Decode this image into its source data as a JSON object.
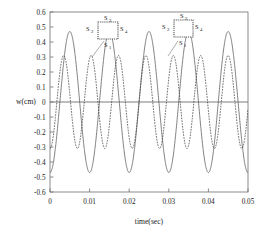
{
  "chart_data": {
    "type": "line",
    "title": "",
    "xlabel": "time(sec)",
    "ylabel": "w(cm)",
    "xlim": [
      0,
      0.05
    ],
    "ylim": [
      -0.6,
      0.6
    ],
    "xticks": [
      0,
      0.01,
      0.02,
      0.03,
      0.04,
      0.05
    ],
    "xticklabels": [
      "0",
      "0.01",
      "0.02",
      "0.03",
      "0.04",
      "0.05"
    ],
    "yticks": [
      -0.6,
      -0.5,
      -0.4,
      -0.3,
      -0.2,
      -0.1,
      0,
      0.1,
      0.2,
      0.3,
      0.4,
      0.5,
      0.6
    ],
    "yticklabels": [
      "-0.6",
      "-0.5",
      "-0.4",
      "-0.3",
      "-0.2",
      "-0.1",
      "0",
      "0.1",
      "0.2",
      "0.3",
      "0.4",
      "0.5",
      "0.6"
    ],
    "grid": false,
    "legend": "none",
    "zero_line": true,
    "series": [
      {
        "name": "solid-curve",
        "style": "solid",
        "color": "#555555",
        "amplitude": 0.47,
        "period": 0.01,
        "phase_deg": -90,
        "points_x": [
          0,
          0.0025,
          0.005,
          0.0075,
          0.01,
          0.0125,
          0.015,
          0.0175,
          0.02,
          0.0225,
          0.025,
          0.0275,
          0.03,
          0.0325,
          0.035,
          0.0375,
          0.04,
          0.0425,
          0.045,
          0.0475,
          0.05
        ],
        "points_y": [
          0.0,
          -0.47,
          0.0,
          0.47,
          0.0,
          -0.47,
          0.0,
          0.47,
          0.0,
          -0.47,
          0.0,
          0.47,
          0.0,
          -0.47,
          0.0,
          0.47,
          0.0,
          -0.47,
          0.0,
          0.47,
          0.0
        ]
      },
      {
        "name": "dashed-curve",
        "style": "dashed",
        "color": "#3a3a3a",
        "amplitude": 0.31,
        "period": 0.00692,
        "phase_deg": -90,
        "points_x": [
          0,
          0.00173,
          0.00346,
          0.00519,
          0.00692,
          0.00865,
          0.01038,
          0.01211,
          0.01384,
          0.01557,
          0.0173,
          0.01903,
          0.02076,
          0.02249,
          0.02422,
          0.02595,
          0.02768,
          0.02941,
          0.03114,
          0.03287,
          0.0346,
          0.03633,
          0.03806,
          0.03979,
          0.04152,
          0.04325,
          0.04498,
          0.04671,
          0.04844,
          0.05
        ],
        "points_y": [
          0.0,
          -0.31,
          0.0,
          0.31,
          0.0,
          -0.31,
          0.0,
          0.31,
          0.0,
          -0.31,
          0.0,
          0.31,
          0.0,
          -0.31,
          0.0,
          0.31,
          0.0,
          -0.31,
          0.0,
          0.31,
          0.0,
          -0.31,
          0.0,
          0.31,
          0.0,
          -0.31,
          0.0,
          0.31,
          0.0,
          0.12
        ]
      }
    ],
    "annotations": [
      {
        "name": "inset-cross-section-1",
        "kind": "square-cross-section",
        "labels": {
          "top": "S",
          "top_sub": "3",
          "left": "S",
          "left_sub": "2",
          "right": "S",
          "right_sub": "4",
          "bottom": "S",
          "bottom_sub": "1"
        }
      },
      {
        "name": "inset-cross-section-2",
        "kind": "square-cross-section",
        "labels": {
          "top": "S",
          "top_sub": "3",
          "left": "S",
          "left_sub": "2",
          "right": "S",
          "right_sub": "4",
          "bottom": "S",
          "bottom_sub": "1"
        }
      }
    ]
  }
}
